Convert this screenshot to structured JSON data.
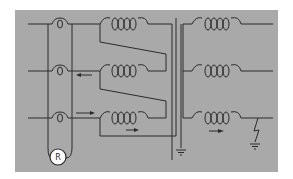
{
  "diagram": {
    "title": "",
    "colors": {
      "background": "#ffffff",
      "panel": "#a9a9a9",
      "line": "#2a2a2a",
      "relay_fill": "#ffffff"
    },
    "phases": [
      {
        "id": "phase-1",
        "y": 24
      },
      {
        "id": "phase-2",
        "y": 71
      },
      {
        "id": "phase-3",
        "y": 118
      }
    ],
    "relay": {
      "label": "R",
      "icon": "relay-circle"
    },
    "arrows": [
      {
        "id": "phase-2-current",
        "direction": "left"
      },
      {
        "id": "phase-3-current-in",
        "direction": "right"
      },
      {
        "id": "phase-3-winding-current",
        "direction": "right"
      },
      {
        "id": "phase-3-output-current",
        "direction": "right"
      }
    ],
    "symbols": [
      {
        "name": "current-transformer",
        "count": 3
      },
      {
        "name": "primary-winding-coil",
        "count": 3
      },
      {
        "name": "secondary-winding-coil",
        "count": 3
      },
      {
        "name": "ground-symbol",
        "count": 2
      },
      {
        "name": "fault-lightning",
        "count": 1
      }
    ]
  }
}
